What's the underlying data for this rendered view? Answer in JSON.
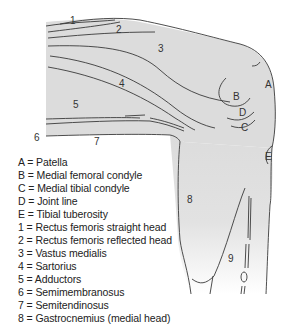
{
  "diagram": {
    "colors": {
      "fill": "#dcdcdc",
      "stroke": "#3a3a3a",
      "background": "#ffffff"
    },
    "labels": {
      "A": "A",
      "B": "B",
      "C": "C",
      "D": "D",
      "E": "E",
      "n1": "1",
      "n2": "2",
      "n3": "3",
      "n4": "4",
      "n5": "5",
      "n6": "6",
      "n7": "7",
      "n8": "8",
      "n9": "9"
    }
  },
  "legend": [
    "A = Patella",
    "B = Medial femoral condyle",
    "C = Medial tibial condyle",
    "D = Joint line",
    "E = Tibial tuberosity",
    "1 = Rectus femoris straight head",
    "2 = Rectus femoris reflected head",
    "3 = Vastus medialis",
    "4 = Sartorius",
    "5 = Adductors",
    "6 = Semimembranosus",
    "7 = Semitendinosus",
    "8 = Gastrocnemius (medial head)"
  ]
}
